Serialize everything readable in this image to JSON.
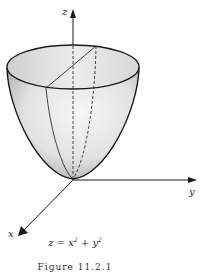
{
  "figure": {
    "axes": {
      "z_label": "z",
      "x_label": "x",
      "y_label": "y"
    },
    "equation": {
      "lhs": "z",
      "eq": " = ",
      "term1_base": "x",
      "term1_exp": "2",
      "plus": " + ",
      "term2_base": "y",
      "term2_exp": "2"
    },
    "caption": "Figure 11.2.1",
    "colors": {
      "line": "#1a1a1a",
      "surface_light": "#f4f4f4",
      "surface_dark": "#b8b8b8"
    }
  }
}
